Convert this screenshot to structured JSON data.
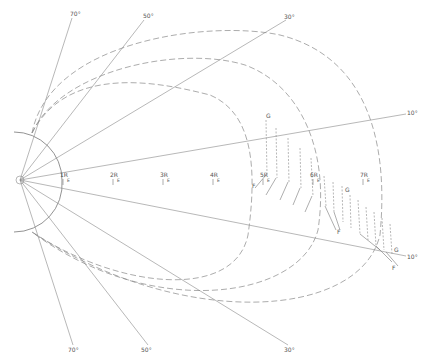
{
  "figure": {
    "type": "polar field-line diagram",
    "colors": {
      "line": "#777777",
      "dashed": "#888888",
      "text": "#555555",
      "background": "#ffffff"
    }
  },
  "latitude_lines": {
    "upper": [
      {
        "label": "70°",
        "end": [
          72,
          15
        ]
      },
      {
        "label": "50°",
        "end": [
          145,
          17
        ]
      },
      {
        "label": "30°",
        "end": [
          285,
          17
        ]
      },
      {
        "label": "10°",
        "end": [
          410,
          112
        ]
      }
    ],
    "lower": [
      {
        "label": "10°",
        "end": [
          410,
          256
        ]
      },
      {
        "label": "30°",
        "end": [
          290,
          348
        ]
      },
      {
        "label": "50°",
        "end": [
          147,
          348
        ]
      },
      {
        "label": "70°",
        "end": [
          73,
          348
        ]
      }
    ]
  },
  "radial_markers": [
    {
      "label": "1R",
      "sub": "E",
      "x": 63,
      "y": 177
    },
    {
      "label": "2R",
      "sub": "E",
      "x": 113,
      "y": 177
    },
    {
      "label": "3R",
      "sub": "E",
      "x": 163,
      "y": 177
    },
    {
      "label": "4R",
      "sub": "E",
      "x": 213,
      "y": 177
    },
    {
      "label": "5R",
      "sub": "E",
      "x": 263,
      "y": 177
    },
    {
      "label": "6R",
      "sub": "E",
      "x": 313,
      "y": 177
    },
    {
      "label": "7R",
      "sub": "E",
      "x": 363,
      "y": 177
    }
  ],
  "vector_labels": [
    {
      "text": "G",
      "x": 268,
      "y": 118
    },
    {
      "text": "F",
      "x": 253,
      "y": 186
    },
    {
      "text": "G",
      "x": 346,
      "y": 190
    },
    {
      "text": "F",
      "x": 338,
      "y": 232
    },
    {
      "text": "G",
      "x": 395,
      "y": 251
    },
    {
      "text": "F",
      "x": 392,
      "y": 268
    }
  ],
  "field_lines": {
    "count": 3,
    "style": "dashed"
  },
  "earth": {
    "label": "",
    "center": [
      20,
      180
    ]
  }
}
